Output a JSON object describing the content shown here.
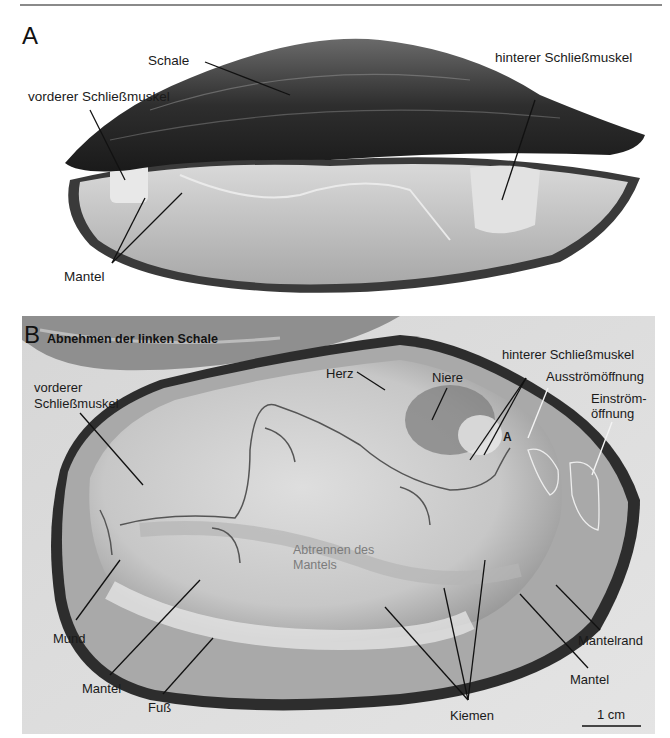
{
  "figure": {
    "panel_a": {
      "letter": "A",
      "labels": {
        "schale": "Schale",
        "hinterer": "hinterer Schließmuskel",
        "vorderer": "vorderer Schließmuskel",
        "mantel": "Mantel"
      }
    },
    "panel_b": {
      "letter": "B",
      "title": "Abnehmen der linken Schale",
      "labels": {
        "vorderer_1": "vorderer",
        "vorderer_2": "Schließmuskel",
        "herz": "Herz",
        "niere": "Niere",
        "hinterer": "hinterer Schließmuskel",
        "ausstroem": "Ausströmöffnung",
        "einstroem_1": "Einström-",
        "einstroem_2": "öffnung",
        "marker_a": "A",
        "abtrennen_1": "Abtrennen des",
        "abtrennen_2": "Mantels",
        "mund": "Mund",
        "mantel_left": "Mantel",
        "fuss": "Fuß",
        "kiemen": "Kiemen",
        "mantelrand": "Mantelrand",
        "mantel_right": "Mantel",
        "scale": "1 cm"
      }
    }
  }
}
